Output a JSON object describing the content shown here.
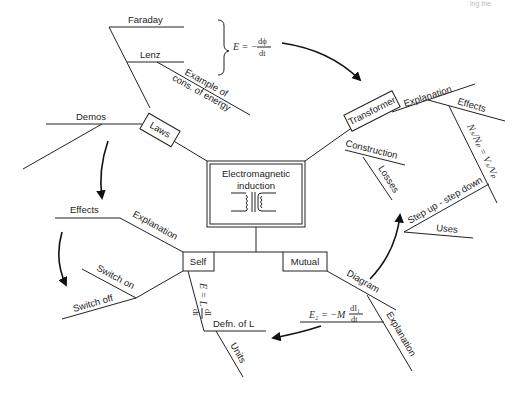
{
  "header": {
    "cut_text": "ing the"
  },
  "center": {
    "title_line1": "Electromagnetic",
    "title_line2": "induction",
    "icon": "transformer-icon"
  },
  "nodes": {
    "laws": "Laws",
    "transformer": "Transformer",
    "self": "Self",
    "mutual": "Mutual"
  },
  "laws_branch": {
    "faraday": "Faraday",
    "lenz": "Lenz",
    "example_line1": "Example of",
    "example_line2": "cons. of energy",
    "demos": "Demos",
    "formula_lhs": "E = −",
    "formula_num": "dϕ",
    "formula_den": "dt"
  },
  "transformer_branch": {
    "explanation": "Explanation",
    "effects": "Effects",
    "ratio": "Nₛ/Nₚ = Vₛ/Vₚ",
    "construction": "Construction",
    "losses": "Losses",
    "step": "Step up - step down",
    "uses": "Uses"
  },
  "self_branch": {
    "effects": "Effects",
    "explanation": "Explanation",
    "switch_on": "Switch on",
    "switch_off": "Switch off",
    "formula_lhs": "E = L",
    "formula_num": "dI",
    "formula_den": "dt",
    "defn": "Defn. of L",
    "units": "Units"
  },
  "mutual_branch": {
    "diagram": "Diagram",
    "explanation": "Explanation",
    "formula_lhs": "E₂ = −M",
    "formula_num": "dI₁",
    "formula_den": "dt"
  }
}
